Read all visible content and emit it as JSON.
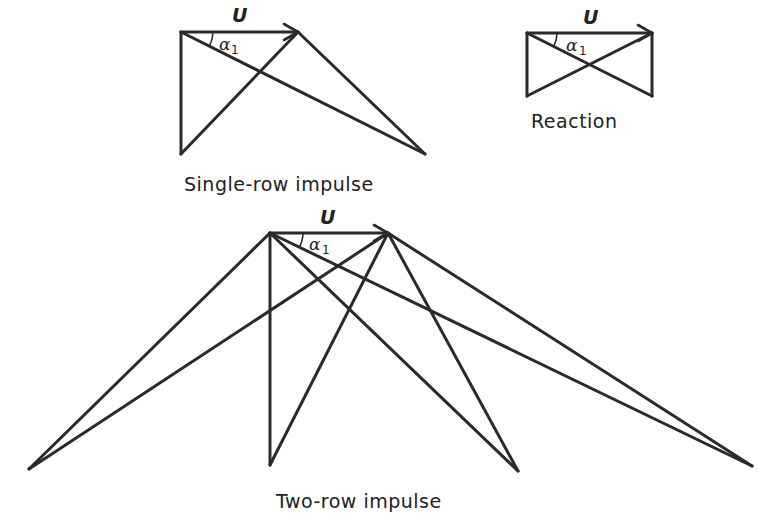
{
  "diagrams": {
    "single_row": {
      "caption": "Single-row impulse",
      "velocity_label": "U",
      "angle_label": "α",
      "angle_subscript": "1"
    },
    "reaction": {
      "caption": "Reaction",
      "velocity_label": "U",
      "angle_label": "α",
      "angle_subscript": "1"
    },
    "two_row": {
      "caption": "Two-row impulse",
      "velocity_label": "U",
      "angle_label": "α",
      "angle_subscript": "1"
    }
  },
  "colors": {
    "line": "#2a2a2a",
    "background": "#ffffff"
  }
}
